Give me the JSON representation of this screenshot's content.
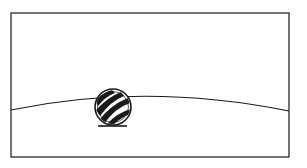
{
  "illustration": {
    "description": "Line drawing of a striped ball resting on a curved horizon inside a rectangular frame",
    "colors": {
      "background": "#ffffff",
      "ink": "#1a1a1a",
      "frame": "#2a2a2a"
    },
    "frame": {
      "x": 11,
      "y": 13,
      "width": 278,
      "height": 144
    },
    "horizon": {
      "left_y": 110,
      "peak_x": 145,
      "peak_y": 96,
      "right_y": 111
    },
    "ball": {
      "cx": 113,
      "cy": 107,
      "r": 18,
      "pattern": "diagonal-stripes"
    },
    "shadow": {
      "cx": 112,
      "cy": 126,
      "rx": 14,
      "ry": 1.5
    }
  }
}
